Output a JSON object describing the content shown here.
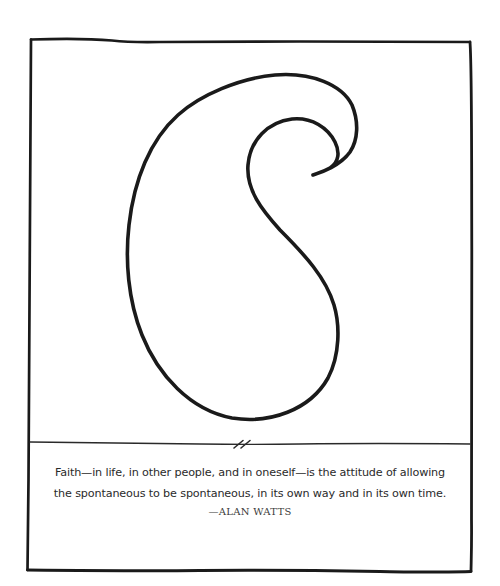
{
  "illustration": {
    "subject": "paisley-outline",
    "stroke_color": "#1a1a1a",
    "background_color": "#ffffff"
  },
  "divider": {
    "mark": "//"
  },
  "quote": {
    "lines": [
      "Faith—in life, in other people, and in oneself—is the attitude of allowing",
      "the spontaneous to be spontaneous, in its own way and in its own time."
    ],
    "attribution": "—ALAN WATTS"
  }
}
